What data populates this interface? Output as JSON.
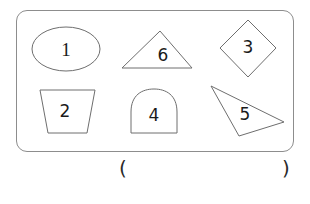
{
  "worksheet": {
    "frame_name": "shape-box",
    "stroke_color": "#6e6e6e",
    "frame_color": "#8d8d8d",
    "digit_color": "#1b1b1b",
    "background": "#ffffff"
  },
  "shapes": [
    {
      "id": "ellipse",
      "label": "1",
      "shape_name": "ellipse",
      "row": "top",
      "column": "left"
    },
    {
      "id": "triangle-isosceles",
      "label": "6",
      "shape_name": "triangle",
      "row": "top",
      "column": "center"
    },
    {
      "id": "diamond",
      "label": "3",
      "shape_name": "diamond",
      "row": "top",
      "column": "right"
    },
    {
      "id": "trapezoid",
      "label": "2",
      "shape_name": "trapezoid",
      "row": "bottom",
      "column": "left"
    },
    {
      "id": "arch",
      "label": "4",
      "shape_name": "arch",
      "row": "bottom",
      "column": "center"
    },
    {
      "id": "triangle-scalene",
      "label": "5",
      "shape_name": "triangle",
      "row": "bottom",
      "column": "right"
    }
  ],
  "answer": {
    "open_paren": "(",
    "close_paren": ")",
    "value": ""
  }
}
